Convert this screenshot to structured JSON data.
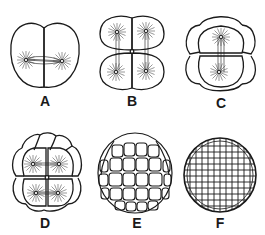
{
  "figure": {
    "stroke_color": "#1a1a1a",
    "background": "#ffffff",
    "panels": [
      {
        "id": "A",
        "label": "A",
        "cells": 2,
        "stage": "2-cell with dividing spindles"
      },
      {
        "id": "B",
        "label": "B",
        "cells": 4,
        "stage": "4-cell with spindles"
      },
      {
        "id": "C",
        "label": "C",
        "cells": 8,
        "stage": "8-cell"
      },
      {
        "id": "D",
        "label": "D",
        "cells": 16,
        "stage": "16-cell"
      },
      {
        "id": "E",
        "label": "E",
        "cells": 32,
        "stage": "morula"
      },
      {
        "id": "F",
        "label": "F",
        "cells": 128,
        "stage": "blastula"
      }
    ]
  }
}
